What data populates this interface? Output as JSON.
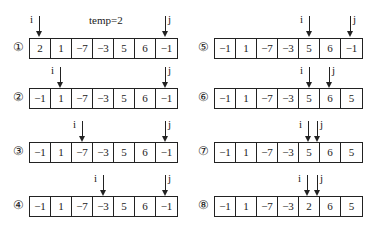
{
  "temp_label": "temp=2",
  "pointer_labels": {
    "i": "i",
    "j": "j"
  },
  "steps": [
    {
      "label": "①",
      "values": [
        "2",
        "1",
        "−7",
        "−3",
        "5",
        "6",
        "−1"
      ],
      "i": 0,
      "j": 6
    },
    {
      "label": "②",
      "values": [
        "−1",
        "1",
        "−7",
        "−3",
        "5",
        "6",
        "−1"
      ],
      "i": 1,
      "j": 6
    },
    {
      "label": "③",
      "values": [
        "−1",
        "1",
        "−7",
        "−3",
        "5",
        "6",
        "−1"
      ],
      "i": 2,
      "j": 6
    },
    {
      "label": "④",
      "values": [
        "−1",
        "1",
        "−7",
        "−3",
        "5",
        "6",
        "−1"
      ],
      "i": 3,
      "j": 6
    },
    {
      "label": "⑤",
      "values": [
        "−1",
        "1",
        "−7",
        "−3",
        "5",
        "6",
        "−1"
      ],
      "i": 4,
      "j": 6
    },
    {
      "label": "⑥",
      "values": [
        "−1",
        "1",
        "−7",
        "−3",
        "5",
        "6",
        "5"
      ],
      "i": 4,
      "j": 5
    },
    {
      "label": "⑦",
      "values": [
        "−1",
        "1",
        "−7",
        "−3",
        "5",
        "6",
        "5"
      ],
      "i": 4,
      "j": 4.6
    },
    {
      "label": "⑧",
      "values": [
        "−1",
        "1",
        "−7",
        "−3",
        "2",
        "6",
        "5"
      ],
      "i": 4,
      "j": 4.6
    }
  ]
}
